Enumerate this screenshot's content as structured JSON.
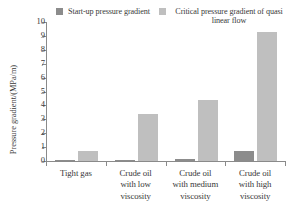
{
  "chart_data": {
    "type": "bar",
    "title": "",
    "xlabel": "",
    "ylabel": "Pressure gradient/(MPa/m)",
    "ylim": [
      0,
      10
    ],
    "yticks": [
      "0",
      "1",
      "2",
      "3",
      "4",
      "5",
      "6",
      "7",
      "8",
      "9",
      "10"
    ],
    "grid": false,
    "legend_position": "top",
    "categories": [
      "Tight gas",
      "Crude oil with low viscosity",
      "Crude oil with medium viscosity",
      "Crude oil with high viscosity"
    ],
    "category_lines": [
      [
        "Tight gas"
      ],
      [
        "Crude oil",
        "with low",
        "viscosity"
      ],
      [
        "Crude oil",
        "with medium",
        "viscosity"
      ],
      [
        "Crude oil",
        "with high",
        "viscosity"
      ]
    ],
    "series": [
      {
        "name": "Start-up pressure gradient",
        "color": "#8c8c8c",
        "values": [
          0.02,
          0.06,
          0.13,
          0.75
        ]
      },
      {
        "name": "Critical pressure gradient of quasi linear flow",
        "color": "#bfbfbf",
        "values": [
          0.75,
          3.35,
          4.4,
          9.25
        ]
      }
    ]
  },
  "legend": {
    "entries": [
      {
        "label": "Start-up pressure gradient",
        "color": "#8c8c8c"
      },
      {
        "label": "Critical pressure gradient of quasi linear flow",
        "color": "#bfbfbf"
      }
    ]
  },
  "axis": {
    "y_title": "Pressure gradient/(MPa/m)"
  }
}
